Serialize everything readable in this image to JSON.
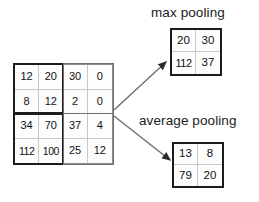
{
  "diagram": {
    "input": {
      "name": "input feature map",
      "rows": [
        [
          "12",
          "20",
          "30",
          "0"
        ],
        [
          "8",
          "12",
          "2",
          "0"
        ],
        [
          "34",
          "70",
          "37",
          "4"
        ],
        [
          "112",
          "100",
          "25",
          "12"
        ]
      ]
    },
    "max_pooling": {
      "label": "max pooling",
      "rows": [
        [
          "20",
          "30"
        ],
        [
          "112",
          "37"
        ]
      ]
    },
    "average_pooling": {
      "label": "average pooling",
      "rows": [
        [
          "13",
          "8"
        ],
        [
          "79",
          "20"
        ]
      ]
    },
    "colors": {
      "stroke_strong": "#1c1c1c",
      "stroke_light": "#c8c8c8",
      "text": "#111111",
      "background": "#ffffff"
    }
  }
}
